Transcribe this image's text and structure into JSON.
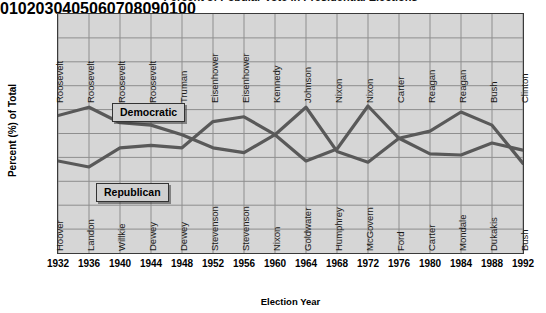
{
  "chart_data": {
    "type": "line",
    "title": "Percent of Popular Vote in Presidential Elections",
    "xlabel": "Election Year",
    "ylabel": "Percent (%) of Total",
    "ylim": [
      0,
      100
    ],
    "yticks": [
      0,
      10,
      20,
      30,
      40,
      50,
      60,
      70,
      80,
      90,
      100
    ],
    "grid": true,
    "legend_position": "inside-plot",
    "x": [
      1932,
      1936,
      1940,
      1944,
      1948,
      1952,
      1956,
      1960,
      1964,
      1968,
      1972,
      1976,
      1980,
      1984,
      1988,
      1992
    ],
    "categories": [
      "1932",
      "1936",
      "1940",
      "1944",
      "1948",
      "1952",
      "1956",
      "1960",
      "1964",
      "1968",
      "1972",
      "1976",
      "1980",
      "1984",
      "1988",
      "1992"
    ],
    "series": [
      {
        "name": "Democratic",
        "values": [
          57.5,
          61,
          54.5,
          53.5,
          49.5,
          44,
          42,
          49.5,
          61,
          42.5,
          38,
          48,
          41.5,
          41,
          46,
          43
        ]
      },
      {
        "name": "Republican",
        "values": [
          38.5,
          36,
          44,
          45,
          44,
          55,
          57,
          49.5,
          38.5,
          43.5,
          61.5,
          48,
          51,
          59,
          53.5,
          37.5
        ]
      }
    ],
    "annotations": {
      "winners": [
        "Roosevelt",
        "Roosevelt",
        "Roosevelt",
        "Roosevelt",
        "Truman",
        "Eisenhower",
        "Eisenhower",
        "Kennedy",
        "Johnson",
        "Nixon",
        "Nixon",
        "Carter",
        "Reagan",
        "Reagan",
        "Bush",
        "Clinton"
      ],
      "losers": [
        "Hoover",
        "Landon",
        "Willkie",
        "Dewey",
        "Dewey",
        "Stevenson",
        "Stevenson",
        "Nixon",
        "Goldwater",
        "Humphrey",
        "McGovern",
        "Ford",
        "Carter",
        "Mondale",
        "Dukakis",
        "Bush"
      ]
    },
    "colors": {
      "line": "#595959",
      "plot_background": "#d6d6d6",
      "legend_background": "#d0d0d0",
      "gridline": "#8e8e8e",
      "axis": "#3a3a3a"
    }
  },
  "legend": {
    "democratic": "Democratic",
    "republican": "Republican"
  }
}
